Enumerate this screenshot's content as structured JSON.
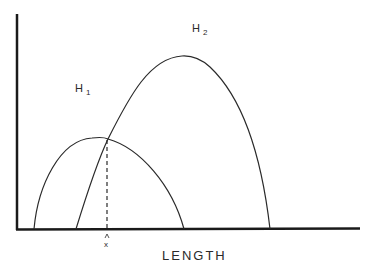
{
  "diagram": {
    "x_axis_label": "LENGTH",
    "marker_label": "x",
    "marker_arrow": "^",
    "curves": [
      {
        "name": "H",
        "subscript": "1",
        "label": "H1"
      },
      {
        "name": "H",
        "subscript": "2",
        "label": "H2"
      }
    ],
    "colors": {
      "line": "#2a2a2a",
      "axis": "#1a1a1a",
      "background": "#ffffff"
    }
  }
}
